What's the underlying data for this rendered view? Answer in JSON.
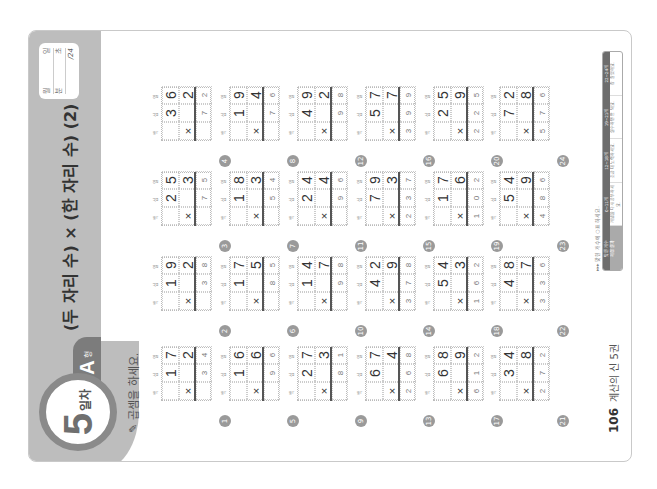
{
  "page": {
    "rotation_deg": -90,
    "header": {
      "day_number": "5",
      "day_suffix": "일차",
      "type_letter": "A",
      "type_suffix": "형",
      "title": "(두 자리 수) × (한 자리 수) (2)",
      "record": {
        "date_labels": [
          "월",
          "일"
        ],
        "time_labels": [
          "분",
          "초"
        ],
        "score_total": "/24"
      }
    },
    "instruction": "곱셈을 하세요.",
    "place_labels": [
      "백",
      "십",
      "일"
    ],
    "problems": [
      {
        "num": "1",
        "a": [
          "1",
          "7"
        ],
        "b": "2",
        "answer": [
          "",
          "3",
          "4"
        ]
      },
      {
        "num": "2",
        "a": [
          "1",
          "9"
        ],
        "b": "2",
        "answer": [
          "",
          "3",
          "8"
        ]
      },
      {
        "num": "3",
        "a": [
          "2",
          "5"
        ],
        "b": "3",
        "answer": [
          "",
          "7",
          "5"
        ]
      },
      {
        "num": "4",
        "a": [
          "3",
          "6"
        ],
        "b": "2",
        "answer": [
          "",
          "7",
          "2"
        ]
      },
      {
        "num": "5",
        "a": [
          "1",
          "6"
        ],
        "b": "6",
        "answer": [
          "",
          "9",
          "6"
        ]
      },
      {
        "num": "6",
        "a": [
          "1",
          "7"
        ],
        "b": "5",
        "answer": [
          "",
          "8",
          "5"
        ]
      },
      {
        "num": "7",
        "a": [
          "1",
          "8"
        ],
        "b": "3",
        "answer": [
          "",
          "5",
          "4"
        ]
      },
      {
        "num": "8",
        "a": [
          "1",
          "9"
        ],
        "b": "4",
        "answer": [
          "",
          "7",
          "6"
        ]
      },
      {
        "num": "9",
        "a": [
          "2",
          "7"
        ],
        "b": "3",
        "answer": [
          "",
          "8",
          "1"
        ]
      },
      {
        "num": "10",
        "a": [
          "1",
          "4"
        ],
        "b": "7",
        "answer": [
          "",
          "9",
          "8"
        ]
      },
      {
        "num": "11",
        "a": [
          "2",
          "4"
        ],
        "b": "4",
        "answer": [
          "",
          "9",
          "6"
        ]
      },
      {
        "num": "12",
        "a": [
          "4",
          "9"
        ],
        "b": "2",
        "answer": [
          "",
          "9",
          "8"
        ]
      },
      {
        "num": "13",
        "a": [
          "6",
          "7"
        ],
        "b": "4",
        "answer": [
          "2",
          "6",
          "8"
        ]
      },
      {
        "num": "14",
        "a": [
          "4",
          "2"
        ],
        "b": "9",
        "answer": [
          "3",
          "7",
          "8"
        ]
      },
      {
        "num": "15",
        "a": [
          "7",
          "9"
        ],
        "b": "3",
        "answer": [
          "2",
          "3",
          "7"
        ]
      },
      {
        "num": "16",
        "a": [
          "5",
          "7"
        ],
        "b": "7",
        "answer": [
          "3",
          "9",
          "9"
        ]
      },
      {
        "num": "17",
        "a": [
          "6",
          "8"
        ],
        "b": "9",
        "answer": [
          "6",
          "1",
          "2"
        ]
      },
      {
        "num": "18",
        "a": [
          "5",
          "4"
        ],
        "b": "3",
        "answer": [
          "1",
          "6",
          "2"
        ]
      },
      {
        "num": "19",
        "a": [
          "1",
          "7"
        ],
        "b": "6",
        "answer": [
          "1",
          "0",
          "2"
        ]
      },
      {
        "num": "20",
        "a": [
          "2",
          "5"
        ],
        "b": "9",
        "answer": [
          "2",
          "2",
          "5"
        ]
      },
      {
        "num": "21",
        "a": [
          "3",
          "4"
        ],
        "b": "8",
        "answer": [
          "2",
          "7",
          "2"
        ]
      },
      {
        "num": "22",
        "a": [
          "4",
          "8"
        ],
        "b": "7",
        "answer": [
          "3",
          "3",
          "6"
        ]
      },
      {
        "num": "23",
        "a": [
          "5",
          "4"
        ],
        "b": "9",
        "answer": [
          "4",
          "8",
          "6"
        ]
      },
      {
        "num": "24",
        "a": [
          "7",
          "2"
        ],
        "b": "8",
        "answer": [
          "5",
          "7",
          "6"
        ]
      }
    ],
    "times_symbol": "×",
    "footer": {
      "page_number": "106",
      "book_title": "계산의 신 5권",
      "score_note": "▸▸▸ 맞힌 개수에 ○표 하세요.",
      "score_columns": [
        "맞힌 개수",
        "0~11개",
        "12~18개",
        "19~21개",
        "22~24개"
      ],
      "score_messages": [
        "채점 결과",
        "개념을 다시 공부하세요.",
        "조금 더 노력하세요.",
        "실수하면 안 돼요.",
        "참 잘했어요."
      ]
    },
    "colors": {
      "band": "#bdbdbd",
      "badge_ring": "#8a8a8a",
      "tab": "#7c7c7c",
      "text": "#333333"
    }
  }
}
